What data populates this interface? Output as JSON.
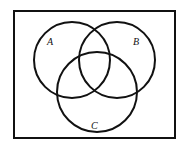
{
  "diagram": {
    "type": "venn",
    "frame": {
      "x": 14,
      "y": 11,
      "width": 161,
      "height": 127,
      "stroke": "#111111"
    },
    "sets": [
      {
        "label": "A",
        "cx": 72,
        "cy": 60,
        "r": 38,
        "label_x": 47,
        "label_y": 45
      },
      {
        "label": "B",
        "cx": 117,
        "cy": 60,
        "r": 38,
        "label_x": 133,
        "label_y": 45
      },
      {
        "label": "C",
        "cx": 97,
        "cy": 92,
        "r": 40,
        "label_x": 91,
        "label_y": 129
      }
    ]
  }
}
